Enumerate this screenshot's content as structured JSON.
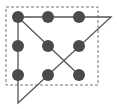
{
  "diagram": {
    "title": "",
    "type": "nine-dots-puzzle",
    "colors": {
      "dot": "#4a4a4a",
      "line": "#555555",
      "box": "#777777",
      "background": "#ffffff"
    },
    "box": {
      "x": 6,
      "y": 7,
      "width": 92,
      "height": 78,
      "style": "dashed"
    },
    "dot_radius": 6,
    "dots": [
      {
        "x": 18,
        "y": 17
      },
      {
        "x": 48,
        "y": 17
      },
      {
        "x": 79,
        "y": 17
      },
      {
        "x": 18,
        "y": 46
      },
      {
        "x": 48,
        "y": 46
      },
      {
        "x": 79,
        "y": 46
      },
      {
        "x": 18,
        "y": 75
      },
      {
        "x": 48,
        "y": 75
      },
      {
        "x": 79,
        "y": 75
      }
    ],
    "path": [
      {
        "x": 18,
        "y": 17
      },
      {
        "x": 111,
        "y": 17
      },
      {
        "x": 18,
        "y": 103
      },
      {
        "x": 18,
        "y": 17
      },
      {
        "x": 79,
        "y": 75
      }
    ]
  }
}
